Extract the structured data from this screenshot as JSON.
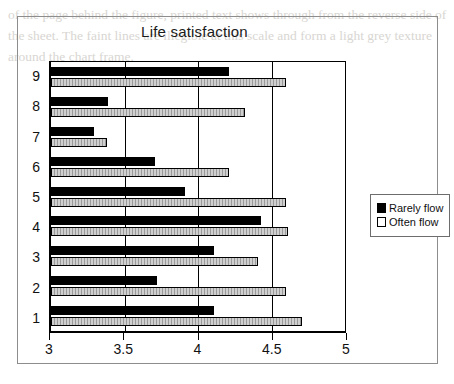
{
  "chart_data": {
    "type": "bar",
    "orientation": "horizontal",
    "title": "Life satisfaction",
    "xlabel": "",
    "ylabel": "",
    "xlim": [
      3,
      5
    ],
    "ylim": null,
    "grid": true,
    "legend_position": "right",
    "xticks": [
      3,
      3.5,
      4,
      4.5,
      5
    ],
    "xtick_labels": [
      "3",
      "3.5",
      "4",
      "4.5",
      "5"
    ],
    "categories": [
      "1",
      "2",
      "3",
      "4",
      "5",
      "6",
      "7",
      "8",
      "9"
    ],
    "category_order_top_to_bottom": [
      "9",
      "8",
      "7",
      "6",
      "5",
      "4",
      "3",
      "2",
      "1"
    ],
    "series": [
      {
        "name": "Rarely flow",
        "color": "#000000",
        "values": [
          4.11,
          3.72,
          4.11,
          4.43,
          3.91,
          3.71,
          3.29,
          3.39,
          4.21
        ]
      },
      {
        "name": "Often flow",
        "color": "#ffffff",
        "values": [
          4.71,
          4.6,
          4.41,
          4.61,
          4.6,
          4.21,
          3.38,
          4.32,
          4.6
        ]
      }
    ]
  },
  "legend": {
    "items": [
      {
        "label": "Rarely flow",
        "swatch": "black-filled-square"
      },
      {
        "label": "Often flow",
        "swatch": "white-outlined-square"
      }
    ]
  },
  "background_text": "of the page behind the figure, printed text shows through from the reverse side of the sheet. The faint lines are illegible at this scale and form a light grey texture around the chart frame."
}
